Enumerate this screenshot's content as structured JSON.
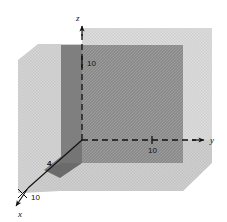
{
  "figure": {
    "background_color": "#ffffff",
    "axes": [
      {
        "id": "z",
        "label": "z",
        "style": "dashed",
        "direction": "up",
        "tick_label": "10"
      },
      {
        "id": "y",
        "label": "y",
        "style": "dashed",
        "direction": "right",
        "tick_label": "10"
      },
      {
        "id": "x",
        "label": "x",
        "style": "solid",
        "direction": "down-left",
        "tick_label": "10"
      }
    ],
    "annotations": [
      {
        "id": "z-tick",
        "text": "10"
      },
      {
        "id": "y-tick",
        "text": "10"
      },
      {
        "id": "x-tick",
        "text": "10"
      },
      {
        "id": "x-intercept",
        "text": "4"
      }
    ],
    "axis_labels": {
      "z": "z",
      "y": "y",
      "x": "x"
    },
    "surfaces": [
      {
        "id": "back-plane",
        "color": "#8d8d8d",
        "name": "back-shaded-plane"
      },
      {
        "id": "left-wall",
        "color": "#cfcfcf",
        "name": "left-shaded-wall"
      },
      {
        "id": "floor",
        "color": "#c9c9c9",
        "name": "floor-shaded-plane"
      },
      {
        "id": "wedge",
        "color": "#7a7a7a",
        "name": "dark-wedge"
      }
    ],
    "colors": {
      "dark_gray": "#8d8d8d",
      "light_gray": "#cfcfcf",
      "floor_gray": "#c9c9c9",
      "wedge_gray": "#7a7a7a",
      "line": "#111111"
    }
  }
}
